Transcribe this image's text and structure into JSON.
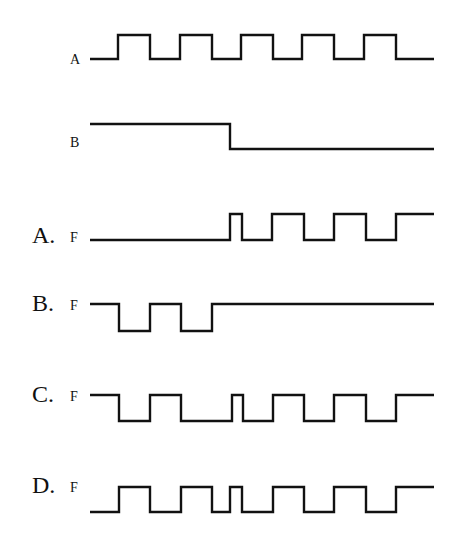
{
  "diagram": {
    "type": "timing-diagram",
    "inputs": [
      {
        "id": "A",
        "label": "A",
        "y_high": 35,
        "y_low": 59,
        "label_x": 70,
        "label_y": 64,
        "start_level": 0,
        "transitions": [
          118,
          150,
          180,
          212,
          241,
          273,
          302,
          334,
          364,
          396
        ]
      },
      {
        "id": "B",
        "label": "B",
        "y_high": 124,
        "y_low": 149,
        "label_x": 70,
        "label_y": 147,
        "start_level": 1,
        "transitions": [
          230
        ]
      }
    ],
    "options": [
      {
        "id": "A",
        "option_label": "A.",
        "signal_label": "F",
        "y_high": 214,
        "y_low": 240,
        "label_y": 243,
        "start_level": 0,
        "transitions": [
          230,
          242,
          272,
          304,
          334,
          366,
          396
        ]
      },
      {
        "id": "B",
        "option_label": "B.",
        "signal_label": "F",
        "y_high": 304,
        "y_low": 331,
        "label_y": 311,
        "start_level": 1,
        "transitions": [
          119,
          150,
          181,
          212
        ]
      },
      {
        "id": "C",
        "option_label": "C.",
        "signal_label": "F",
        "y_high": 395,
        "y_low": 421,
        "label_y": 402,
        "start_level": 1,
        "transitions": [
          119,
          150,
          181,
          232,
          243,
          273,
          304,
          334,
          366,
          396
        ]
      },
      {
        "id": "D",
        "option_label": "D.",
        "signal_label": "F",
        "y_high": 487,
        "y_low": 512,
        "label_y": 493,
        "start_level": 0,
        "transitions": [
          119,
          150,
          181,
          212,
          230,
          242,
          273,
          304,
          334,
          366,
          396
        ]
      }
    ],
    "x_start": 90,
    "x_end": 434
  }
}
